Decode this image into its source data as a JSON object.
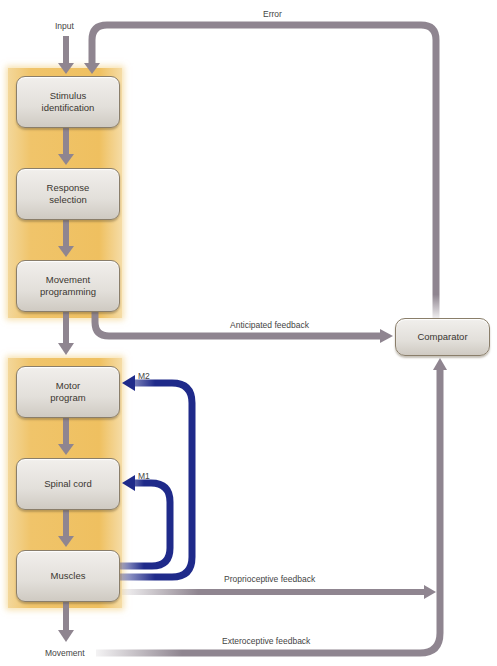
{
  "diagram": {
    "type": "flow-diagram",
    "title": "",
    "colors": {
      "panel": "#efc060",
      "box": "#e2dfda",
      "arrow_gray": "#8f8590",
      "arrow_blue": "#1f2a8a"
    },
    "labels": {
      "input": "Input",
      "error": "Error",
      "anticipated": "Anticipated feedback",
      "m2": "M2",
      "m1": "M1",
      "proprioceptive": "Proprioceptive feedback",
      "exteroceptive": "Exteroceptive feedback",
      "movement": "Movement"
    },
    "upper_stage": [
      {
        "id": "stimulus",
        "label": "Stimulus\nidentification"
      },
      {
        "id": "response",
        "label": "Response\nselection"
      },
      {
        "id": "programming",
        "label": "Movement\nprogramming"
      }
    ],
    "lower_stage": [
      {
        "id": "motor",
        "label": "Motor\nprogram"
      },
      {
        "id": "spinal",
        "label": "Spinal cord"
      },
      {
        "id": "muscles",
        "label": "Muscles"
      }
    ],
    "comparator": {
      "label": "Comparator"
    },
    "edges": [
      {
        "from": "Input",
        "to": "Stimulus identification"
      },
      {
        "from": "Stimulus identification",
        "to": "Response selection"
      },
      {
        "from": "Response selection",
        "to": "Movement programming"
      },
      {
        "from": "Movement programming",
        "to": "Motor program"
      },
      {
        "from": "Motor program",
        "to": "Spinal cord"
      },
      {
        "from": "Spinal cord",
        "to": "Muscles"
      },
      {
        "from": "Muscles",
        "to": "Movement"
      },
      {
        "from": "Movement programming",
        "to": "Comparator",
        "label": "Anticipated feedback"
      },
      {
        "from": "Comparator",
        "to": "Stimulus identification",
        "label": "Error"
      },
      {
        "from": "Muscles",
        "to": "Motor program",
        "label": "M2"
      },
      {
        "from": "Muscles",
        "to": "Spinal cord",
        "label": "M1"
      },
      {
        "from": "Muscles",
        "to": "Comparator",
        "label": "Proprioceptive feedback"
      },
      {
        "from": "Movement",
        "to": "Comparator",
        "label": "Exteroceptive feedback"
      }
    ]
  }
}
